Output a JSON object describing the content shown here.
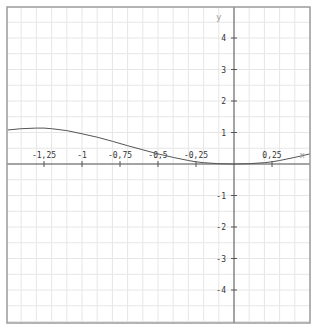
{
  "chart_data": {
    "type": "line",
    "title": "",
    "xlabel": "x",
    "ylabel": "y",
    "xlim": [
      -1.49,
      0.5
    ],
    "ylim": [
      -5.0,
      5.0
    ],
    "grid": true,
    "grid_minor_x_step": 0.1,
    "grid_minor_y_step": 0.5,
    "x_ticks": [
      {
        "value": -1.25,
        "label": "-1,25"
      },
      {
        "value": -1,
        "label": "-1"
      },
      {
        "value": -0.75,
        "label": "-0,75"
      },
      {
        "value": -0.5,
        "label": "-0,5"
      },
      {
        "value": -0.25,
        "label": "-0,25"
      },
      {
        "value": 0.25,
        "label": "0,25"
      }
    ],
    "y_ticks": [
      {
        "value": 4,
        "label": "4"
      },
      {
        "value": 3,
        "label": "3"
      },
      {
        "value": 2,
        "label": "2"
      },
      {
        "value": 1,
        "label": "1"
      },
      {
        "value": -1,
        "label": "-1"
      },
      {
        "value": -2,
        "label": "-2"
      },
      {
        "value": -3,
        "label": "-3"
      },
      {
        "value": -4,
        "label": "-4"
      }
    ],
    "series": [
      {
        "name": "f(x)",
        "color": "#555555",
        "x": [
          -1.49,
          -1.4,
          -1.3,
          -1.25,
          -1.2,
          -1.1,
          -1.0,
          -0.9,
          -0.8,
          -0.75,
          -0.7,
          -0.6,
          -0.5,
          -0.4,
          -0.3,
          -0.25,
          -0.2,
          -0.1,
          0.0,
          0.1,
          0.2,
          0.25,
          0.3,
          0.4,
          0.5
        ],
        "values": [
          1.08,
          1.12,
          1.14,
          1.14,
          1.12,
          1.06,
          0.96,
          0.85,
          0.72,
          0.65,
          0.58,
          0.45,
          0.32,
          0.21,
          0.11,
          0.07,
          0.04,
          0.01,
          0.0,
          0.01,
          0.04,
          0.07,
          0.11,
          0.21,
          0.32
        ]
      }
    ]
  },
  "colors": {
    "frame": "#9a9a9a",
    "grid": "#e6e6e6",
    "axis": "#555555",
    "curve": "#555555"
  }
}
